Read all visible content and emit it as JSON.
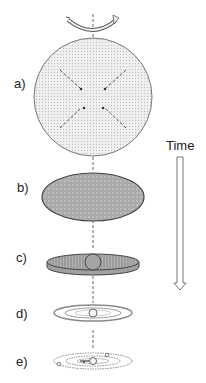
{
  "diagram": {
    "stages": [
      {
        "id": "a",
        "label": "a)",
        "description": "Rotating spherical cloud collapsing inward"
      },
      {
        "id": "b",
        "label": "b)",
        "description": "Flattened rotating ellipsoid"
      },
      {
        "id": "c",
        "label": "c)",
        "description": "Disk with central protostar"
      },
      {
        "id": "d",
        "label": "d)",
        "description": "Thin disk with rings and central star"
      },
      {
        "id": "e",
        "label": "e)",
        "description": "Planets forming in orbits around central star"
      }
    ],
    "time_axis": {
      "label": "Time",
      "direction": "down"
    },
    "colors": {
      "stroke": "#555555",
      "cloud_fill": "#e6e6e6",
      "ellipsoid_fill": "#a8a8a8",
      "disk_fill": "#9a9a9a",
      "arrow_stroke": "#666666"
    }
  }
}
